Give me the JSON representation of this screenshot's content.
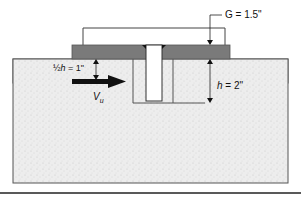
{
  "diagram": {
    "type": "anchor-embedment-cross-section",
    "labels": {
      "gap": "G = 1.5\"",
      "embed_depth_var": "h",
      "embed_depth_value": " = 2\"",
      "half_h_prefix": "½",
      "half_h_var": "h",
      "half_h_value": " = 1\"",
      "shear_var": "V",
      "shear_sub": "u"
    },
    "colors": {
      "plate": "#7a7a7a",
      "concrete": "#ececec",
      "outline": "#555555",
      "arrow": "#111111",
      "rule": "#222222"
    }
  }
}
